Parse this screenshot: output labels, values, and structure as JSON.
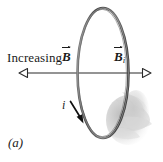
{
  "figure": {
    "panel_label": "(a)",
    "background_color": "#ffffff",
    "ink_color": "#1b1b1b",
    "loop_color": "#585858",
    "shadow_color": "#c9c9c9"
  },
  "labels": {
    "increasing_field": {
      "text": "Increasing",
      "symbol": "B",
      "symbol_subscript": "",
      "vector": true,
      "name": "increasing-applied-field-label"
    },
    "induced_field": {
      "symbol": "B",
      "symbol_subscript": "i",
      "vector": true,
      "name": "induced-field-label"
    },
    "current": {
      "symbol": "i",
      "name": "induced-current-label"
    }
  },
  "arrows": {
    "applied_field_arrow": {
      "direction": "left",
      "style": "open-head",
      "from_x": 150,
      "to_x": 20,
      "y": 73
    },
    "induced_field_arrow": {
      "direction": "right",
      "style": "open-head",
      "from_x": 20,
      "to_x": 150,
      "y": 73
    },
    "current_arrow": {
      "direction": "down-right",
      "style": "solid-head"
    }
  },
  "loop": {
    "shape": "ellipse",
    "center_x": 103,
    "center_y": 73,
    "radius_x": 25,
    "radius_y": 65,
    "name": "conducting-loop"
  }
}
